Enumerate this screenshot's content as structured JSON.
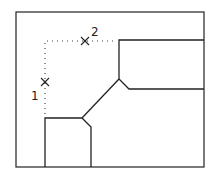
{
  "diagram": {
    "type": "technical drawing - corner fillet/chamfer pick points",
    "frame": {
      "x": 16,
      "y": 12,
      "w": 188,
      "h": 155
    },
    "stroke_color": "#222222",
    "markers": [
      {
        "id": "1",
        "label": "1",
        "x": 45,
        "y": 82
      },
      {
        "id": "2",
        "label": "2",
        "x": 85,
        "y": 41
      }
    ],
    "dotted_guide": "corner construction lines from lower-left box top to upper channel"
  }
}
